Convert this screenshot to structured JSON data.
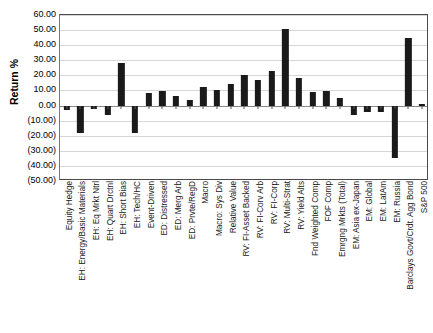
{
  "chart_data": {
    "type": "bar",
    "title": "",
    "xlabel": "",
    "ylabel": "Return %",
    "ylim": [
      -50,
      60
    ],
    "ytick_step": 10,
    "grid": true,
    "legend": false,
    "bar_color": "#1a1a1a",
    "ytick_labels": [
      "60.00",
      "50.00",
      "40.00",
      "30.00",
      "20.00",
      "10.00",
      "0.00",
      "(10.00)",
      "(20.00)",
      "(30.00)",
      "(40.00)",
      "(50.00)"
    ],
    "ytick_values": [
      60,
      50,
      40,
      30,
      20,
      10,
      0,
      -10,
      -20,
      -30,
      -40,
      -50
    ],
    "categories": [
      "Equity Hedge",
      "EH: Energy/Basic Materials",
      "EH: Eq Mrkt Ntrl",
      "EH: Quart Drctnl",
      "EH: Short Bias",
      "EH: Tech/HC",
      "Event-Driven",
      "ED: Distressed",
      "ED: Merg Arb",
      "ED: Prvte/RegD",
      "Macro",
      "Macro: Sys Div",
      "Relative Value",
      "RV: FI-Asset Backed",
      "RV: FI-Corv Arb",
      "RV: FI-Corp",
      "RV: Multi-Strat",
      "RV: Yield Alts",
      "Fnd Weighted Comp",
      "FOF Comp",
      "Emrgng Mrkts (Total)",
      "EM: Asia ex-Japan",
      "EM: Global",
      "EM: LatAm",
      "EM: Russia",
      "Barclays Govt/Crdt. Agg Bond",
      "S&P 500"
    ],
    "values": [
      -3.0,
      -18.0,
      -2.0,
      -6.5,
      28.0,
      -18.0,
      8.0,
      9.5,
      6.0,
      4.0,
      12.5,
      10.0,
      14.0,
      20.0,
      17.0,
      23.0,
      51.0,
      18.0,
      9.0,
      9.5,
      5.0,
      -6.5,
      -4.5,
      -4.5,
      -35.0,
      45.0,
      1.0
    ]
  }
}
